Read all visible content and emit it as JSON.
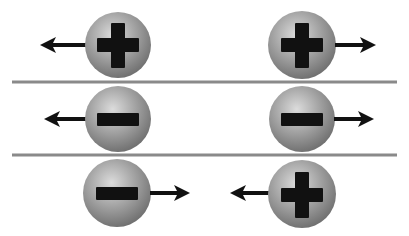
{
  "colors": {
    "background": "#ffffff",
    "sphere_light": "#d9d9d9",
    "sphere_mid": "#a6a6a6",
    "sphere_dark": "#6e6e6e",
    "symbol": "#111111",
    "arrow": "#111111",
    "divider": "#8a8a8a"
  },
  "rows": [
    {
      "name": "positive-positive-repel",
      "interaction": "repel",
      "particles": [
        {
          "charge": "positive",
          "symbol": "plus",
          "cx": 118,
          "cy": 45,
          "arrow": "left"
        },
        {
          "charge": "positive",
          "symbol": "plus",
          "cx": 302,
          "cy": 45,
          "arrow": "right"
        }
      ]
    },
    {
      "name": "negative-negative-repel",
      "interaction": "repel",
      "particles": [
        {
          "charge": "negative",
          "symbol": "minus",
          "cx": 118,
          "cy": 119,
          "arrow": "left"
        },
        {
          "charge": "negative",
          "symbol": "minus",
          "cx": 302,
          "cy": 119,
          "arrow": "right"
        }
      ]
    },
    {
      "name": "negative-positive-attract",
      "interaction": "attract",
      "particles": [
        {
          "charge": "negative",
          "symbol": "minus",
          "cx": 117,
          "cy": 193,
          "arrow": "right"
        },
        {
          "charge": "positive",
          "symbol": "plus",
          "cx": 302,
          "cy": 193,
          "arrow": "left"
        }
      ]
    }
  ],
  "dividers": [
    {
      "y": 82,
      "x1": 12,
      "x2": 397
    },
    {
      "y": 155,
      "x1": 12,
      "x2": 397
    }
  ]
}
